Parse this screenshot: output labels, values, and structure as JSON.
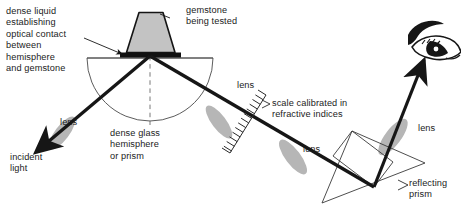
{
  "diagram": {
    "background_color": "#ffffff",
    "ink_color": "#161616",
    "gem_fill": "#c3c3c3",
    "lens_fill": "#b6b6b6",
    "liquid_color": "#111111",
    "outline_color": "#3a3a3a"
  },
  "labels": {
    "dense_liquid": "dense liquid\nestablishing\noptical contact\nbetween\nhemisphere\nand gemstone",
    "gemstone": "gemstone\nbeing tested",
    "hemisphere": "dense glass\nhemisphere\nor prism",
    "incident_light": "incident\nlight",
    "lens_left": "lens",
    "lens_scale": "lens",
    "lens_mid": "lens",
    "lens_right": "lens",
    "scale": "scale calibrated in\nrefractive indices",
    "reflecting_prism": "reflecting\nprism"
  },
  "parts": {
    "gemstone_shape": "trapezoid",
    "hemisphere_shape": "semicircle-flat-top",
    "liquid_shape": "thin-black-band",
    "lens_shape": "ellipse-rotated",
    "prism_shape": "triangle-with-inscribed-quad",
    "eye_shape": "stylized-eye",
    "centerline_style": "dashed-vertical",
    "scale_ticks": 14
  },
  "icon_names": {
    "eye": "eye-icon",
    "incident_arrow": "incident-light-arrow-icon",
    "exit_arrow": "viewing-arrow-icon",
    "leader_arrow": "leader-arrow-icon"
  }
}
